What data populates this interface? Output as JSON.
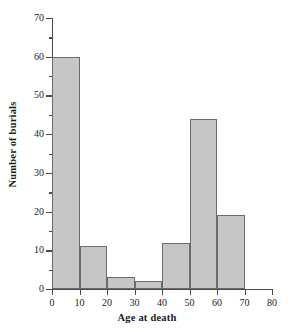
{
  "chart_data": {
    "type": "bar",
    "title": "",
    "xlabel": "Age at death",
    "ylabel": "Number of burials",
    "categories": [
      "0-10",
      "10-20",
      "20-30",
      "30-40",
      "40-50",
      "50-60",
      "60-70"
    ],
    "bin_edges": [
      0,
      10,
      20,
      30,
      40,
      50,
      60,
      70
    ],
    "values": [
      60,
      11,
      3,
      2,
      12,
      44,
      19
    ],
    "xlim": [
      0,
      80
    ],
    "ylim": [
      0,
      70
    ],
    "xticks": [
      0,
      10,
      20,
      30,
      40,
      50,
      60,
      70,
      80
    ],
    "xtick_labels": [
      "0",
      "10",
      "20",
      "30",
      "40",
      "50",
      "60",
      "70",
      "80"
    ],
    "yticks": [
      0,
      10,
      20,
      30,
      40,
      50,
      60,
      70
    ],
    "ytick_labels": [
      "0",
      "10",
      "20",
      "30",
      "40",
      "50",
      "60",
      "70"
    ],
    "yticks_minor": [
      5,
      15,
      25,
      35,
      45,
      55,
      65
    ],
    "grid": false,
    "legend": null,
    "bar_fill_color": "#c6c6c6",
    "bar_edge_color": "#6b6b6b",
    "axis_color": "#4a4a4a"
  }
}
